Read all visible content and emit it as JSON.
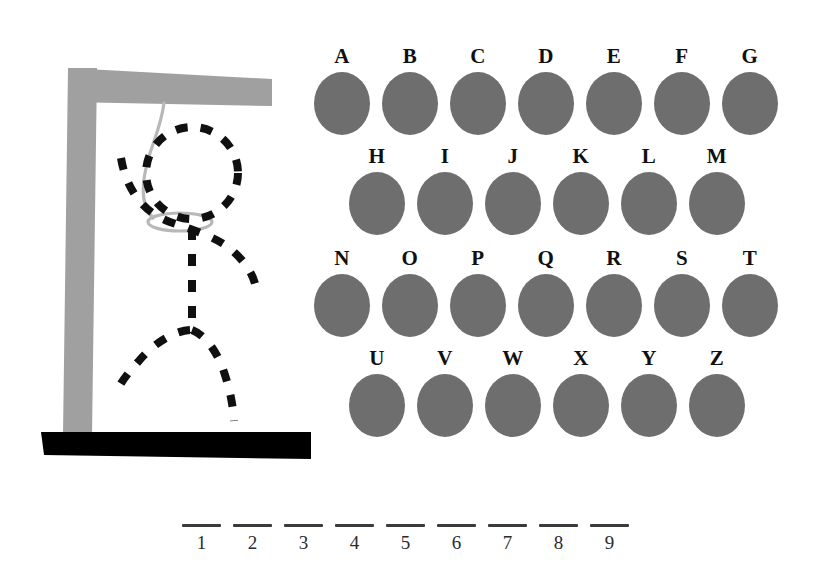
{
  "game": {
    "title": "Hangman",
    "colors": {
      "background": "#ffffff",
      "gallows_post": "#a0a0a0",
      "gallows_beam": "#a0a0a0",
      "ground_bar": "#000000",
      "rope": "#b8b8b8",
      "figure_stroke": "#101010",
      "letter_button": "#6e6e6e",
      "letter_label": "#101010",
      "blank_line": "#3a3a3a"
    }
  },
  "gallows": {
    "parts": [
      {
        "name": "ground-bar",
        "drawn": true
      },
      {
        "name": "vertical-post",
        "drawn": true
      },
      {
        "name": "horizontal-beam",
        "drawn": true
      },
      {
        "name": "rope",
        "drawn": true
      },
      {
        "name": "noose-loop",
        "drawn": true
      }
    ]
  },
  "figure": {
    "parts": [
      {
        "name": "head",
        "drawn": true
      },
      {
        "name": "arms",
        "drawn": true
      },
      {
        "name": "torso",
        "drawn": true
      },
      {
        "name": "legs",
        "drawn": true
      }
    ],
    "style": "dashed"
  },
  "keyboard": {
    "rows": [
      {
        "letters": [
          "A",
          "B",
          "C",
          "D",
          "E",
          "F",
          "G"
        ]
      },
      {
        "letters": [
          "H",
          "I",
          "J",
          "K",
          "L",
          "M"
        ]
      },
      {
        "letters": [
          "N",
          "O",
          "P",
          "Q",
          "R",
          "S",
          "T"
        ]
      },
      {
        "letters": [
          "U",
          "V",
          "W",
          "X",
          "Y",
          "Z"
        ]
      }
    ]
  },
  "word": {
    "length": 9,
    "slots": [
      {
        "number": "1",
        "letter": ""
      },
      {
        "number": "2",
        "letter": ""
      },
      {
        "number": "3",
        "letter": ""
      },
      {
        "number": "4",
        "letter": ""
      },
      {
        "number": "5",
        "letter": ""
      },
      {
        "number": "6",
        "letter": ""
      },
      {
        "number": "7",
        "letter": ""
      },
      {
        "number": "8",
        "letter": ""
      },
      {
        "number": "9",
        "letter": ""
      }
    ]
  }
}
